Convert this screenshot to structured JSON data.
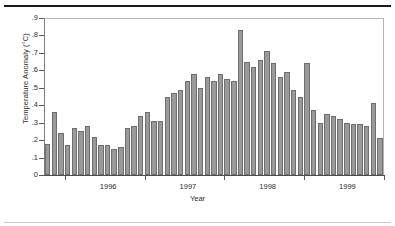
{
  "chart_data": {
    "type": "bar",
    "title": "",
    "subtitle": "",
    "xlabel": "Year",
    "ylabel": "Temperature Anomaly (°C)",
    "ylim": [
      0,
      0.9
    ],
    "grid": false,
    "legend": "none",
    "bar_color": "#9a9a9a",
    "bar_edge_color": "#6e6e6e",
    "ytick_labels": [
      ".9",
      ".8",
      ".7",
      ".6",
      ".5",
      ".4",
      ".3",
      ".2",
      ".1",
      "0"
    ],
    "ytick_values": [
      0.9,
      0.8,
      0.7,
      0.6,
      0.5,
      0.4,
      0.3,
      0.2,
      0.1,
      0
    ],
    "xtick_labels": [
      "1996",
      "1997",
      "1998",
      "1999"
    ],
    "xtick_positions": [
      9,
      21,
      33,
      45
    ],
    "xminor_positions": [
      3,
      15,
      27,
      39,
      51
    ],
    "categories": [
      "1995-08",
      "1995-09",
      "1995-10",
      "1995-11",
      "1995-12",
      "1996-01",
      "1996-02",
      "1996-03",
      "1996-04",
      "1996-05",
      "1996-06",
      "1996-07",
      "1996-08",
      "1996-09",
      "1996-10",
      "1996-11",
      "1996-12",
      "1997-01",
      "1997-02",
      "1997-03",
      "1997-04",
      "1997-05",
      "1997-06",
      "1997-07",
      "1997-08",
      "1997-09",
      "1997-10",
      "1997-11",
      "1997-12",
      "1998-01",
      "1998-02",
      "1998-03",
      "1998-04",
      "1998-05",
      "1998-06",
      "1998-07",
      "1998-08",
      "1998-09",
      "1998-10",
      "1998-11",
      "1998-12",
      "1999-01",
      "1999-02",
      "1999-03",
      "1999-04",
      "1999-05",
      "1999-06",
      "1999-07",
      "1999-08",
      "1999-09",
      "1999-10"
    ],
    "values": [
      0.18,
      0.36,
      0.24,
      0.17,
      0.27,
      0.25,
      0.28,
      0.22,
      0.17,
      0.17,
      0.15,
      0.16,
      0.27,
      0.28,
      0.34,
      0.36,
      0.31,
      0.31,
      0.45,
      0.47,
      0.49,
      0.54,
      0.58,
      0.5,
      0.56,
      0.54,
      0.58,
      0.55,
      0.54,
      0.83,
      0.65,
      0.62,
      0.66,
      0.71,
      0.64,
      0.56,
      0.59,
      0.49,
      0.45,
      0.64,
      0.37,
      0.3,
      0.35,
      0.34,
      0.32,
      0.3,
      0.29,
      0.29,
      0.28,
      0.41,
      0.21
    ]
  }
}
